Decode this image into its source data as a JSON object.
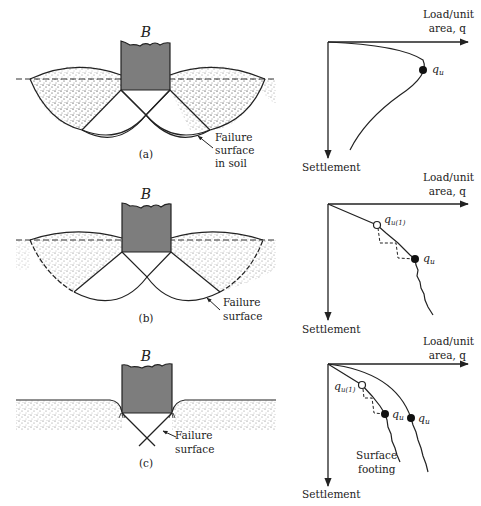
{
  "figure": {
    "panels": [
      {
        "id": "a",
        "caption": "(a)",
        "footing_label": "B",
        "failure_label_line1": "Failure",
        "failure_label_line2": "surface",
        "failure_label_line3": "in soil",
        "graph": {
          "x_axis_line1": "Load/unit",
          "x_axis_line2": "area, q",
          "y_axis": "Settlement",
          "points": [
            {
              "label": "q",
              "sub": "u",
              "type": "filled"
            }
          ]
        }
      },
      {
        "id": "b",
        "caption": "(b)",
        "footing_label": "B",
        "failure_label_line1": "Failure",
        "failure_label_line2": "surface",
        "graph": {
          "x_axis_line1": "Load/unit",
          "x_axis_line2": "area, q",
          "y_axis": "Settlement",
          "points": [
            {
              "label": "q",
              "sub": "u(1)",
              "type": "open"
            },
            {
              "label": "q",
              "sub": "u",
              "type": "filled"
            }
          ]
        }
      },
      {
        "id": "c",
        "caption": "(c)",
        "footing_label": "B",
        "failure_label_line1": "Failure",
        "failure_label_line2": "surface",
        "graph": {
          "x_axis_line1": "Load/unit",
          "x_axis_line2": "area, q",
          "y_axis": "Settlement",
          "curve_label_line1": "Surface",
          "curve_label_line2": "footing",
          "points": [
            {
              "label": "q",
              "sub": "u(1)",
              "type": "open"
            },
            {
              "label": "q",
              "sub": "u",
              "type": "filled"
            },
            {
              "label": "q",
              "sub": "u",
              "type": "filled"
            }
          ]
        }
      }
    ]
  }
}
